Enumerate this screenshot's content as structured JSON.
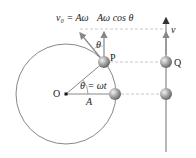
{
  "diagram": {
    "type": "reference-circle-shm",
    "labels": {
      "tangential_velocity": "v₀ = Aω",
      "vertical_component": "Aω cos θ",
      "angle_at_p": "θ",
      "point_p": "P",
      "point_q": "Q",
      "velocity_q": "v",
      "origin": "O",
      "angle": "θ = ωt",
      "radius": "A"
    },
    "colors": {
      "line": "#888888",
      "ball": "#9a9a9a",
      "dash": "#c8c8c8",
      "text": "#222222"
    }
  }
}
